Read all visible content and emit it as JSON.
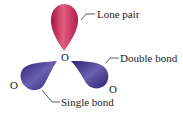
{
  "diagram": {
    "atoms": {
      "center": "O",
      "left": "O",
      "right": "O"
    },
    "labels": {
      "lone_pair": "Lone pair",
      "double_bond": "Double bond",
      "single_bond": "Single bond"
    },
    "colors": {
      "lone_pair_lobe": "#c8305a",
      "bond_lobe": "#4a3a8c"
    }
  }
}
